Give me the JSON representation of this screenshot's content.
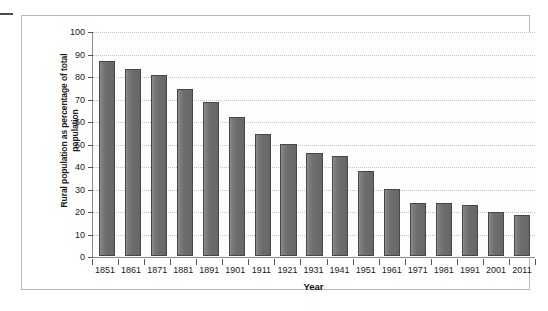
{
  "chart_data": {
    "type": "bar",
    "title": "",
    "xlabel": "Year",
    "ylabel": "Rural population as percentage of total population",
    "ylabel_line1": "Rural population as percentage of total",
    "ylabel_line2": "population",
    "ylim": [
      0,
      100
    ],
    "ytick_step": 10,
    "yticks": [
      100,
      90,
      80,
      70,
      60,
      50,
      40,
      30,
      20,
      10,
      0
    ],
    "grid": "horizontal-dotted",
    "legend": "none",
    "bar_color": "#6d6d6d",
    "bar_edge_color": "#474747",
    "gridline_color": "#c3c3c3",
    "axis_color": "#8a8a8a",
    "frame_color": "#b9b9b9",
    "categories": [
      "1851",
      "1861",
      "1871",
      "1881",
      "1891",
      "1901",
      "1911",
      "1921",
      "1931",
      "1941",
      "1951",
      "1961",
      "1971",
      "1981",
      "1991",
      "2001",
      "2011"
    ],
    "values": [
      87.0,
      83.7,
      80.7,
      74.5,
      68.7,
      62.2,
      54.3,
      50.0,
      45.9,
      44.8,
      38.0,
      30.0,
      23.5,
      23.7,
      22.8,
      19.6,
      18.2
    ],
    "series": [
      {
        "name": "Rural population as percentage of total population",
        "values": [
          87.0,
          83.7,
          80.7,
          74.5,
          68.7,
          62.2,
          54.3,
          50.0,
          45.9,
          44.8,
          38.0,
          30.0,
          23.5,
          23.7,
          22.8,
          19.6,
          18.2
        ]
      }
    ]
  }
}
